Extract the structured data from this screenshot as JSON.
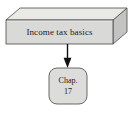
{
  "diagram": {
    "type": "flow-diagram",
    "background_color": "#ffffff",
    "nodes": [
      {
        "id": "income-tax-basics",
        "shape": "3d-box",
        "label": "Income tax basics",
        "front_fill": "#d9d9d7",
        "top_fill": "#e9e9e7",
        "side_fill": "#c3c3c1",
        "stroke": "#4a4a4a",
        "text_color": "#1a1a1a"
      },
      {
        "id": "chapter-reference",
        "shape": "rounded-rect",
        "label_line1": "Chap.",
        "label_line2": "17",
        "fill": "#dcdcda",
        "stroke": "#5a5a5a",
        "text_color": "#1a1a1a"
      }
    ],
    "connectors": [
      {
        "id": "basics-to-chapter",
        "from": "income-tax-basics",
        "to": "chapter-reference",
        "direction": "down",
        "arrowhead": "solid-triangle",
        "color": "#111111"
      }
    ]
  }
}
